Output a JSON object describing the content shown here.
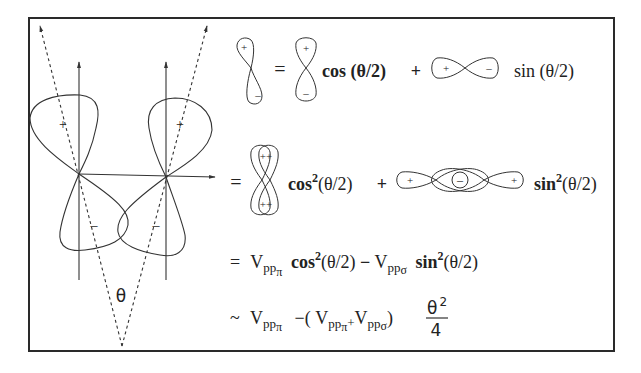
{
  "colors": {
    "background": "#ffffff",
    "ink": "#333333",
    "frame": "#2a2a2a"
  },
  "diagram": {
    "left_panel": {
      "angle_label": "θ",
      "left_orbital": {
        "upper_lobe_sign": "+",
        "lower_lobe_sign": "–"
      },
      "right_orbital": {
        "upper_lobe_sign": "+",
        "lower_lobe_sign": "–"
      }
    },
    "equations": {
      "row1": {
        "glyph_tilted_signs": [
          "+",
          "–"
        ],
        "equals": "=",
        "glyph_vertical_signs": [
          "+",
          "–"
        ],
        "term1": "cos (θ/2)",
        "plus": "+",
        "glyph_horizontal_signs": [
          "+",
          "–"
        ],
        "term2": "sin (θ/2)"
      },
      "row2": {
        "equals": "=",
        "glyph_double_vertical_signs": [
          "++",
          "++"
        ],
        "term1_fn": "cos",
        "term1_exp": "2",
        "term1_arg": "(θ/2)",
        "plus": "+",
        "glyph_double_horizontal_signs": [
          "+",
          "–",
          "+"
        ],
        "term2_fn": "sin",
        "term2_exp": "2",
        "term2_arg": "(θ/2)"
      },
      "row3": {
        "equals": "=",
        "v1": "V",
        "v1_sub": "pp",
        "v1_subsub": "π",
        "cos_fn": "cos",
        "cos_exp": "2",
        "cos_arg": "(θ/2)",
        "minus": "−",
        "v2": "V",
        "v2_sub": "pp",
        "v2_subsub": "σ",
        "sin_fn": "sin",
        "sin_exp": "2",
        "sin_arg": "(θ/2)"
      },
      "row4": {
        "approx": "~",
        "v1": "V",
        "v1_sub": "pp",
        "v1_subsub": "π",
        "minus_paren": "−(",
        "v2": "V",
        "v2_sub": "pp",
        "v2_subsub": "π",
        "plus": "+",
        "v3": "V",
        "v3_sub": "pp",
        "v3_subsub": "σ",
        "close_paren": ")",
        "frac_num": "θ",
        "frac_num_exp": "2",
        "frac_den": "4"
      }
    }
  }
}
